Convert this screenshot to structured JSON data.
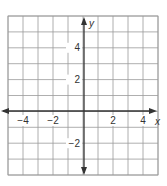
{
  "chart_data": {
    "type": "scatter",
    "title": "",
    "xlabel": "x",
    "ylabel": "y",
    "xlim": [
      -5,
      5
    ],
    "ylim": [
      -4,
      6
    ],
    "grid": true,
    "grid_step": 1,
    "x_ticks": [
      {
        "value": -4,
        "label": "−4"
      },
      {
        "value": -2,
        "label": "−2"
      },
      {
        "value": 2,
        "label": "2"
      },
      {
        "value": 4,
        "label": "4"
      }
    ],
    "y_ticks": [
      {
        "value": 4,
        "label": "4"
      },
      {
        "value": 2,
        "label": "2"
      },
      {
        "value": -2,
        "label": "−2"
      }
    ],
    "series": []
  },
  "axes": {
    "x_label": "x",
    "y_label": "y"
  },
  "colors": {
    "grid": "#9a9a9a",
    "axis": "#333333",
    "background": "#ffffff"
  }
}
